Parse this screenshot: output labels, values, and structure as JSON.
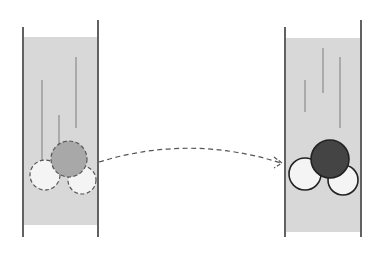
{
  "diagram": {
    "type": "before-after-settling",
    "colors": {
      "background": "#ffffff",
      "fluid": "#d8d8d8",
      "wall": "#3a3a3a",
      "streak": "#8c8c8c",
      "particle_light": "#f4f4f4",
      "particle_gray": "#a8a8a8",
      "particle_dark": "#444444",
      "outline_dashed": "#555555",
      "outline_solid": "#222222",
      "arrow": "#555555"
    },
    "left_tube": {
      "label": "before",
      "walls": [
        {
          "x": 23,
          "y1": 27,
          "y2": 237
        },
        {
          "x": 98,
          "y1": 20,
          "y2": 237
        }
      ],
      "fluid": {
        "x": 24,
        "y": 37,
        "w": 73,
        "h": 188
      },
      "streaks": [
        {
          "x": 42,
          "y1": 80,
          "y2": 165
        },
        {
          "x": 59,
          "y1": 115,
          "y2": 150
        },
        {
          "x": 76,
          "y1": 57,
          "y2": 128
        }
      ],
      "particles": [
        {
          "name": "particle-light-left",
          "cx": 45,
          "cy": 175,
          "r": 15,
          "fill": "particle_light",
          "style": "dashed"
        },
        {
          "name": "particle-light-right",
          "cx": 82,
          "cy": 180,
          "r": 14,
          "fill": "particle_light",
          "style": "dashed"
        },
        {
          "name": "particle-center",
          "cx": 69,
          "cy": 159,
          "r": 18,
          "fill": "particle_gray",
          "style": "dashed"
        }
      ]
    },
    "right_tube": {
      "label": "after",
      "walls": [
        {
          "x": 285,
          "y1": 27,
          "y2": 237
        },
        {
          "x": 361,
          "y1": 20,
          "y2": 237
        }
      ],
      "fluid": {
        "x": 286,
        "y": 38,
        "w": 74,
        "h": 194
      },
      "streaks": [
        {
          "x": 305,
          "y1": 80,
          "y2": 112
        },
        {
          "x": 323,
          "y1": 48,
          "y2": 93
        },
        {
          "x": 340,
          "y1": 57,
          "y2": 128
        }
      ],
      "particles": [
        {
          "name": "particle-light-left",
          "cx": 305,
          "cy": 174,
          "r": 16,
          "fill": "particle_light",
          "style": "solid"
        },
        {
          "name": "particle-light-right",
          "cx": 343,
          "cy": 180,
          "r": 15,
          "fill": "particle_light",
          "style": "solid"
        },
        {
          "name": "particle-center",
          "cx": 330,
          "cy": 159,
          "r": 19,
          "fill": "particle_dark",
          "style": "solid"
        }
      ]
    },
    "arrow": {
      "style": "dashed",
      "path": "M 99 162 Q 190 134 281 163",
      "head": "M 274 157 L 282 163 L 274 168"
    }
  }
}
